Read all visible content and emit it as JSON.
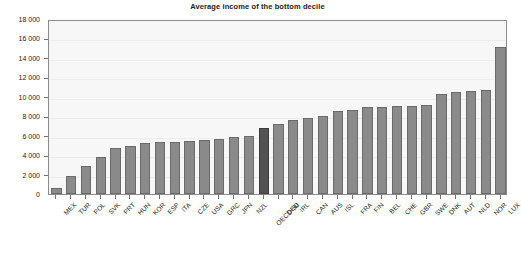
{
  "chart_data": {
    "type": "bar",
    "title": "Average income of the bottom decile",
    "xlabel": "",
    "ylabel": "",
    "ylim": [
      0,
      18000
    ],
    "ytick_values": [
      0,
      2000,
      4000,
      6000,
      8000,
      10000,
      12000,
      14000,
      16000,
      18000
    ],
    "ytick_labels": [
      "0",
      "2 000",
      "4 000",
      "6 000",
      "8 000",
      "10 000",
      "12 000",
      "14 000",
      "16 000",
      "18 000"
    ],
    "grid": true,
    "legend": "none",
    "bar_color": "#8a8a8a",
    "highlight_color": "#525252",
    "highlight_category": "OECD-30",
    "plot_background": "#f7f7f7",
    "axis_color": "#8c8c8c",
    "categories": [
      "MEX",
      "TUR",
      "POL",
      "SVK",
      "PRT",
      "HUN",
      "KOR",
      "ESP",
      "ITA",
      "CZE",
      "USA",
      "GRC",
      "JPN",
      "NZL",
      "OECD-30",
      "DEU",
      "IRL",
      "CAN",
      "AUS",
      "ISL",
      "FRA",
      "FIN",
      "BEL",
      "CHE",
      "GBR",
      "SWE",
      "DNK",
      "AUT",
      "NLD",
      "NOR",
      "LUX"
    ],
    "values": [
      600,
      1900,
      2900,
      3800,
      4700,
      4900,
      5200,
      5300,
      5400,
      5500,
      5600,
      5700,
      5900,
      6000,
      6800,
      7200,
      7600,
      7800,
      8000,
      8500,
      8600,
      8900,
      9000,
      9100,
      9100,
      9200,
      10300,
      10500,
      10600,
      10700,
      15100
    ]
  }
}
